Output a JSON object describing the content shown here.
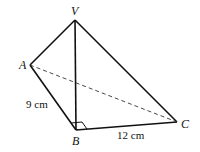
{
  "figure": {
    "type": "pyramid",
    "vertices": {
      "V": {
        "label": "V",
        "x": 75,
        "y": 20
      },
      "A": {
        "label": "A",
        "x": 30,
        "y": 65
      },
      "B": {
        "label": "B",
        "x": 76,
        "y": 130
      },
      "C": {
        "label": "C",
        "x": 177,
        "y": 122
      }
    },
    "measurements": {
      "AB": "9 cm",
      "BC": "12 cm"
    },
    "right_angle_at": "B",
    "hidden_edge": "AC"
  }
}
